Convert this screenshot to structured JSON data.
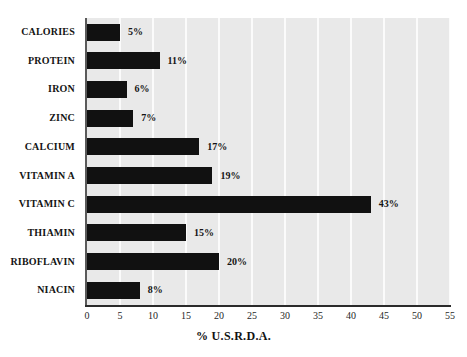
{
  "chart_data": {
    "type": "bar",
    "orientation": "horizontal",
    "title": "",
    "xlabel": "% U.S.R.D.A.",
    "ylabel": "",
    "categories": [
      "CALORIES",
      "PROTEIN",
      "IRON",
      "ZINC",
      "CALCIUM",
      "VITAMIN A",
      "VITAMIN C",
      "THIAMIN",
      "RIBOFLAVIN",
      "NIACIN"
    ],
    "values": [
      5,
      11,
      6,
      7,
      17,
      19,
      43,
      15,
      20,
      8
    ],
    "value_labels": [
      "5%",
      "11%",
      "6%",
      "7%",
      "17%",
      "19%",
      "43%",
      "15%",
      "20%",
      "8%"
    ],
    "xlim": [
      0,
      55
    ],
    "xticks": [
      0,
      5,
      10,
      15,
      20,
      25,
      30,
      35,
      40,
      45,
      50,
      55
    ],
    "xtick_labels": [
      "0",
      "5",
      "10",
      "15",
      "20",
      "25",
      "30",
      "35",
      "40",
      "45",
      "50",
      "55"
    ],
    "grid": "vertical-only",
    "legend": "none",
    "colors": {
      "bar": "#111111",
      "plot_background": "#e9e9e9",
      "gridline": "#fbfbfb",
      "axis": "#2b2b2b",
      "page_background": "#ffffff",
      "text": "#141414"
    }
  }
}
